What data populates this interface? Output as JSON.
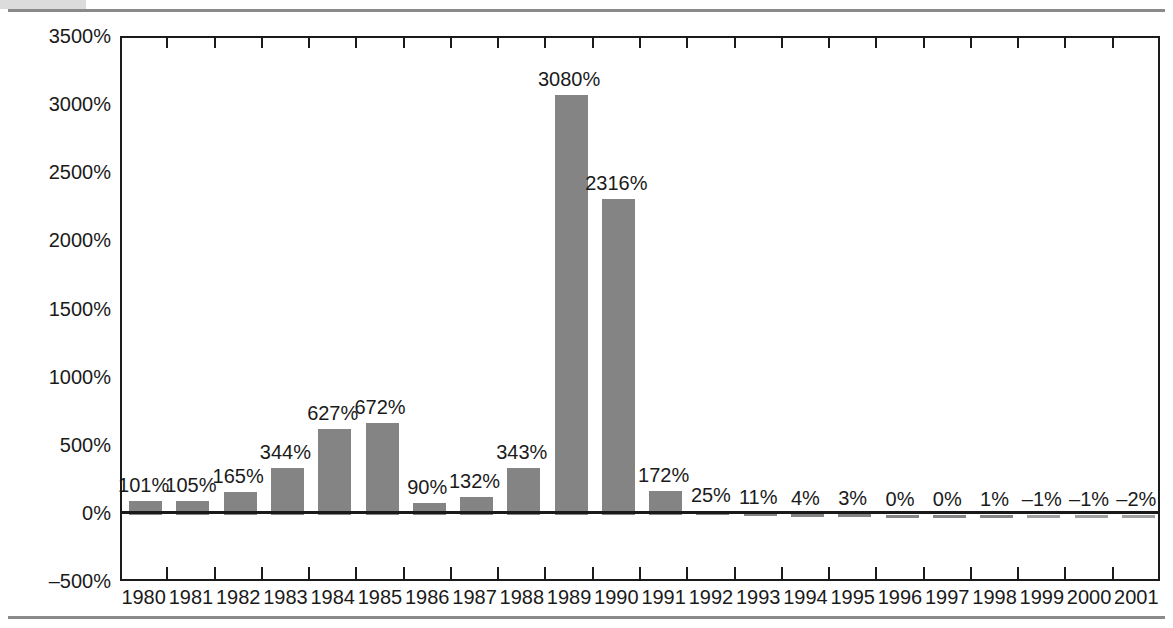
{
  "chart_data": {
    "type": "bar",
    "title": "",
    "xlabel": "",
    "ylabel": "Consumer price inflation in Argentina",
    "ylim": [
      -500,
      3500
    ],
    "ytick_step": 500,
    "grid": false,
    "legend": null,
    "bar_color": "#848484",
    "axis_color": "#1a1a1a",
    "categories": [
      "1980",
      "1981",
      "1982",
      "1983",
      "1984",
      "1985",
      "1986",
      "1987",
      "1988",
      "1989",
      "1990",
      "1991",
      "1992",
      "1993",
      "1994",
      "1995",
      "1996",
      "1997",
      "1998",
      "1999",
      "2000",
      "2001"
    ],
    "values": [
      101,
      105,
      165,
      344,
      627,
      672,
      90,
      132,
      343,
      3080,
      2316,
      172,
      25,
      11,
      4,
      3,
      0,
      0,
      1,
      -1,
      -1,
      -2
    ],
    "value_labels": [
      "101%",
      "105%",
      "165%",
      "344%",
      "627%",
      "672%",
      "90%",
      "132%",
      "343%",
      "3080%",
      "2316%",
      "172%",
      "25%",
      "11%",
      "4%",
      "3%",
      "0%",
      "0%",
      "1%",
      "–1%",
      "–1%",
      "–2%"
    ],
    "ytick_labels": [
      "3500%",
      "3000%",
      "2500%",
      "2000%",
      "1500%",
      "1000%",
      "500%",
      "0%",
      "–500%"
    ],
    "ytick_values": [
      3500,
      3000,
      2500,
      2000,
      1500,
      1000,
      500,
      0,
      -500
    ]
  }
}
